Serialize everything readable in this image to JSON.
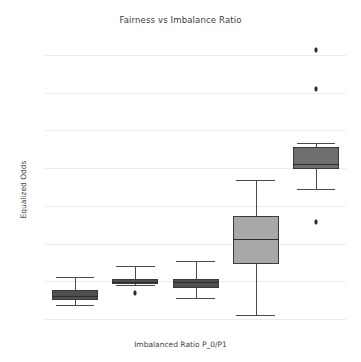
{
  "chart_data": {
    "type": "box",
    "title": "Fairness vs Imbalance Ratio",
    "xlabel": "Imbalanced Ratio P_0/P1",
    "ylabel": "Equalized Odds",
    "categories": [
      "40/60",
      "30/70",
      "20/80",
      "10/90",
      "1/99"
    ],
    "ylim": [
      -0.005,
      0.745
    ],
    "yticks": [
      0.0,
      0.1,
      0.2,
      0.3,
      0.4,
      0.5,
      0.6,
      0.7
    ],
    "ytick_labels": [
      "0.0",
      "0.1",
      "0.2",
      "0.3",
      "0.4",
      "0.5",
      "0.6",
      "0.7"
    ],
    "grid": "horizontal",
    "legend": "none",
    "boxes": [
      {
        "category": "40/60",
        "whisker_low": 0.038,
        "q1": 0.05,
        "median": 0.062,
        "q3": 0.076,
        "whisker_high": 0.112,
        "fliers": [],
        "fill": "#4f4f4f"
      },
      {
        "category": "30/70",
        "whisker_low": 0.09,
        "q1": 0.094,
        "median": 0.099,
        "q3": 0.106,
        "whisker_high": 0.14,
        "fliers": [
          0.068
        ],
        "fill": "#4f4f4f"
      },
      {
        "category": "20/80",
        "whisker_low": 0.057,
        "q1": 0.082,
        "median": 0.098,
        "q3": 0.107,
        "whisker_high": 0.155,
        "fliers": [],
        "fill": "#4f4f4f"
      },
      {
        "category": "10/90",
        "whisker_low": 0.012,
        "q1": 0.147,
        "median": 0.212,
        "q3": 0.272,
        "whisker_high": 0.368,
        "fliers": [],
        "fill": "#a8a8a8"
      },
      {
        "category": "1/99",
        "whisker_low": 0.345,
        "q1": 0.397,
        "median": 0.41,
        "q3": 0.457,
        "whisker_high": 0.467,
        "fliers": [
          0.712,
          0.611,
          0.258
        ],
        "fill": "#6e6e6e"
      }
    ]
  },
  "colors": {
    "grid": "#ececf0",
    "text": "#55555c",
    "title": "#3c3c3c",
    "edge": "#3a3a3a",
    "flier": "#2b2b2b",
    "background": "#ffffff"
  }
}
